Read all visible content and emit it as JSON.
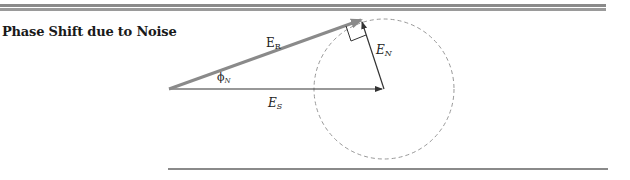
{
  "heading": "Phase Shift due to Noise",
  "diagram": {
    "labels": {
      "er_main": "E",
      "er_sub": "R",
      "en_main": "E",
      "en_sub": "N",
      "es_main": "E",
      "es_sub": "S",
      "phi_main": "ϕ",
      "phi_sub": "N"
    },
    "colors": {
      "er_vector": "#8a8a8a",
      "es_vector": "#333333",
      "en_vector": "#333333",
      "circle": "#999999",
      "rules": "#8a8a8a"
    }
  }
}
